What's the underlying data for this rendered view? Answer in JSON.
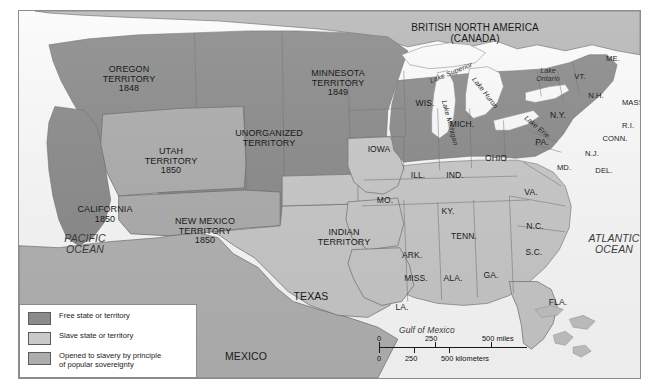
{
  "map": {
    "title_region": "BRITISH NORTH AMERICA\n(CANADA)",
    "oceans": {
      "pacific": "PACIFIC\nOCEAN",
      "atlantic": "ATLANTIC\nOCEAN",
      "gulf": "Gulf of Mexico"
    },
    "countries": {
      "mexico": "MEXICO",
      "canada": "BRITISH NORTH AMERICA (CANADA)"
    },
    "lakes": [
      {
        "name": "Lake Superior"
      },
      {
        "name": "Lake Michigan"
      },
      {
        "name": "Lake Huron"
      },
      {
        "name": "Lake Erie"
      },
      {
        "name": "Lake Ontario"
      }
    ],
    "territories": [
      {
        "name": "OREGON\nTERRITORY",
        "year": "1848",
        "status": "free"
      },
      {
        "name": "MINNESOTA\nTERRITORY",
        "year": "1849",
        "status": "free"
      },
      {
        "name": "UNORGANIZED\nTERRITORY",
        "year": "",
        "status": "free"
      },
      {
        "name": "UTAH\nTERRITORY",
        "year": "1850",
        "status": "popular-sovereignty"
      },
      {
        "name": "NEW MEXICO\nTERRITORY",
        "year": "1850",
        "status": "popular-sovereignty"
      },
      {
        "name": "INDIAN\nTERRITORY",
        "year": "",
        "status": "slave"
      },
      {
        "name": "CALIFORNIA",
        "year": "1850",
        "status": "free"
      }
    ],
    "states": [
      {
        "label": "WIS.",
        "status": "free"
      },
      {
        "label": "MICH.",
        "status": "free"
      },
      {
        "label": "IOWA",
        "status": "free"
      },
      {
        "label": "ILL.",
        "status": "free"
      },
      {
        "label": "IND.",
        "status": "free"
      },
      {
        "label": "OHIO",
        "status": "free"
      },
      {
        "label": "PA.",
        "status": "free"
      },
      {
        "label": "N.Y.",
        "status": "free"
      },
      {
        "label": "ME.",
        "status": "free"
      },
      {
        "label": "VT.",
        "status": "free"
      },
      {
        "label": "N.H.",
        "status": "free"
      },
      {
        "label": "MASS.",
        "status": "free"
      },
      {
        "label": "R.I.",
        "status": "free"
      },
      {
        "label": "CONN.",
        "status": "free"
      },
      {
        "label": "N.J.",
        "status": "free"
      },
      {
        "label": "DEL.",
        "status": "slave"
      },
      {
        "label": "MD.",
        "status": "slave"
      },
      {
        "label": "VA.",
        "status": "slave"
      },
      {
        "label": "KY.",
        "status": "slave"
      },
      {
        "label": "MO.",
        "status": "slave"
      },
      {
        "label": "N.C.",
        "status": "slave"
      },
      {
        "label": "TENN.",
        "status": "slave"
      },
      {
        "label": "S.C.",
        "status": "slave"
      },
      {
        "label": "ARK.",
        "status": "slave"
      },
      {
        "label": "GA.",
        "status": "slave"
      },
      {
        "label": "MISS.",
        "status": "slave"
      },
      {
        "label": "ALA.",
        "status": "slave"
      },
      {
        "label": "LA.",
        "status": "slave"
      },
      {
        "label": "FLA.",
        "status": "slave"
      },
      {
        "label": "TEXAS",
        "status": "slave"
      }
    ]
  },
  "legend": {
    "items": [
      {
        "label": "Free state or territory",
        "color": "#8b8b8b"
      },
      {
        "label": "Slave state or territory",
        "color": "#c9c9c9"
      },
      {
        "label": "Opened to slavery by principle\nof popular sovereignty",
        "color": "#adadad"
      }
    ]
  },
  "scale": {
    "miles": {
      "unit": "miles",
      "ticks": [
        "0",
        "250",
        "500"
      ]
    },
    "kilometers": {
      "unit": "kilometers",
      "ticks": [
        "0",
        "250",
        "500"
      ]
    },
    "miles_label": "500 miles",
    "km_label": "500 kilometers"
  },
  "colors": {
    "free": "#8b8b8b",
    "slave": "#c9c9c9",
    "popular_sovereignty": "#adadad",
    "water": "#fbfbfb",
    "canada": "#b8b8b8",
    "mexico": "#b3b3b3",
    "border": "#6e6e6e"
  }
}
